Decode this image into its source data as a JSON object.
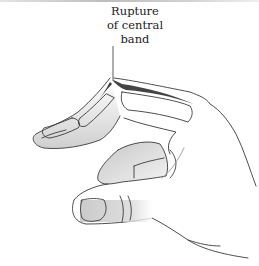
{
  "figure": {
    "annotation": {
      "lines": [
        "Rupture",
        "of central",
        "band"
      ]
    },
    "colors": {
      "line": "#3a3a3a",
      "shade_dark": "#8a8a8a",
      "shade_light": "#d8d8d8",
      "background": "#ffffff"
    }
  }
}
